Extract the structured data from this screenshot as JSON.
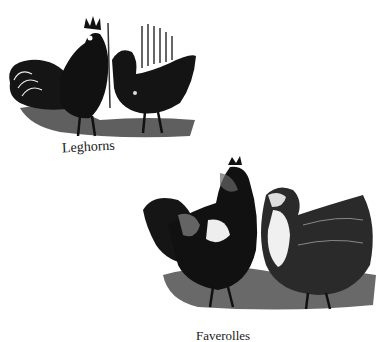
{
  "figures": [
    {
      "caption": "Leghorns",
      "description": "rooster and hen, dark plumage"
    },
    {
      "caption": "Faverolles",
      "description": "rooster and hen, mottled plumage"
    }
  ],
  "colors": {
    "ink": "#1a1a1a",
    "paper": "#ffffff"
  }
}
